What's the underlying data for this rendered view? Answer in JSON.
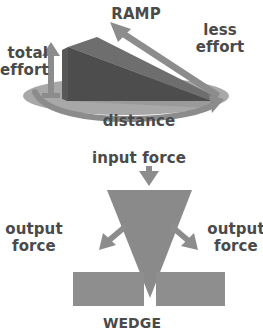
{
  "figure": {
    "caption": "Simple machines: ramp (inclined plane) and wedge force diagrams",
    "background_color": "#ffffff",
    "text_color": "#4a4a4a"
  },
  "palette": {
    "text": "#4a4a4a",
    "arrow_gray": "#8c8c8c",
    "ground_ellipse": "#a8a8a8",
    "ramp_side_dark": "#4d4d4d",
    "ramp_top_mid": "#6e6e6e",
    "ramp_front_light": "#9a9a9a",
    "wedge_gray": "#8a8a8a",
    "block_gray": "#8e8e8e"
  },
  "ramp_panel": {
    "title": "RAMP",
    "labels": {
      "less_effort": "less\neffort",
      "total_effort": "total\neffort",
      "distance": "distance"
    },
    "icons": {
      "total_effort_arrow": "arrow-up-icon",
      "less_effort_arrow": "arrow-up-left-icon",
      "distance_arrow": "arrow-curved-right-icon"
    },
    "shapes": {
      "ground": "ellipse-ground",
      "incline": "ramp-wedge-3d"
    }
  },
  "wedge_panel": {
    "title": "WEDGE",
    "labels": {
      "input_force": "input force",
      "output_force_left": "output\nforce",
      "output_force_right": "output\nforce"
    },
    "icons": {
      "input_arrow": "arrow-down-icon",
      "output_arrow_left": "arrow-down-left-icon",
      "output_arrow_right": "arrow-down-right-icon"
    },
    "shapes": {
      "wedge": "inverted-triangle",
      "split_block_left": "rectangle-left",
      "split_block_right": "rectangle-right"
    }
  }
}
